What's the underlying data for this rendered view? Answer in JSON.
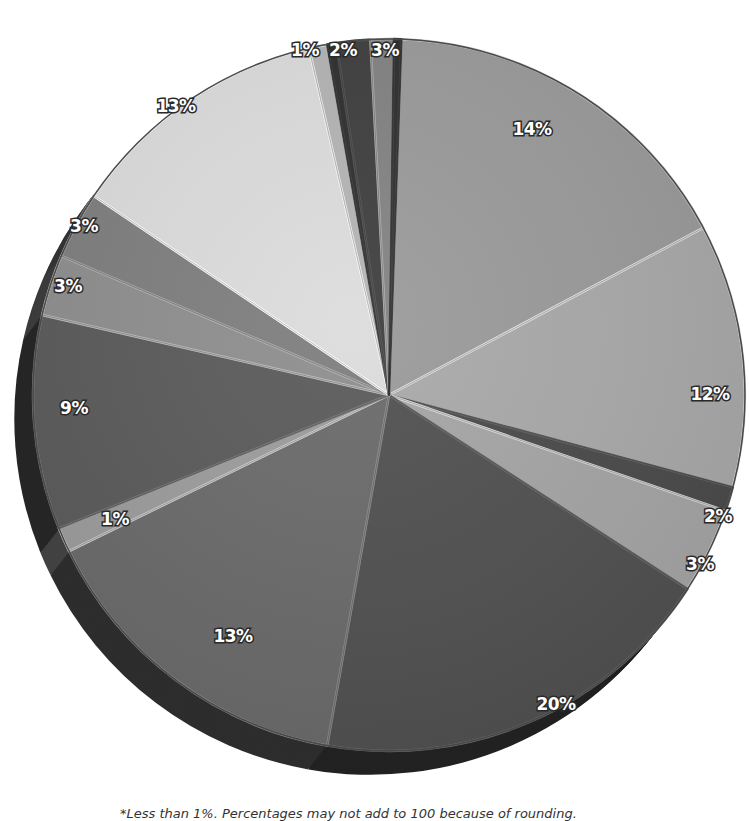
{
  "chart_data": {
    "type": "pie",
    "title": "",
    "style": "3d-exploded-grayscale",
    "center": [
      389,
      395
    ],
    "radius": 356,
    "start_angle_deg": 2,
    "slices": [
      {
        "label": "14%",
        "value": 14,
        "start": 2,
        "end": 62,
        "color": "#9a9a9a",
        "label_pos": [
          532,
          135
        ]
      },
      {
        "label": "12%",
        "value": 12,
        "start": 62,
        "end": 105,
        "color": "#a9a9a9",
        "label_pos": [
          710,
          400
        ]
      },
      {
        "label": "2%",
        "value": 2,
        "start": 105,
        "end": 109,
        "color": "#4a4a4a",
        "label_pos": [
          718,
          522
        ]
      },
      {
        "label": "3%",
        "value": 3,
        "start": 109,
        "end": 123,
        "color": "#a5a5a5",
        "label_pos": [
          700,
          570
        ]
      },
      {
        "label": "20%",
        "value": 20,
        "start": 123,
        "end": 190,
        "color": "#505050",
        "label_pos": [
          556,
          710
        ]
      },
      {
        "label": "13%",
        "value": 13,
        "start": 190,
        "end": 244,
        "color": "#6a6a6a",
        "label_pos": [
          233,
          642
        ]
      },
      {
        "label": "1%",
        "value": 1,
        "start": 244,
        "end": 248,
        "color": "#9c9c9c",
        "label_pos": [
          115,
          525
        ]
      },
      {
        "label": "9%",
        "value": 9,
        "start": 248,
        "end": 283,
        "color": "#5a5a5a",
        "label_pos": [
          74,
          414
        ]
      },
      {
        "label": "3%",
        "value": 3,
        "start": 283,
        "end": 293,
        "color": "#8e8e8e",
        "label_pos": [
          68,
          292
        ]
      },
      {
        "label": "3%",
        "value": 3,
        "start": 293,
        "end": 304,
        "color": "#7e7e7e",
        "label_pos": [
          84,
          232
        ]
      },
      {
        "label": "13%",
        "value": 13,
        "start": 304,
        "end": 347,
        "color": "#dcdcdc",
        "label_pos": [
          176,
          112
        ]
      },
      {
        "label": "1%",
        "value": 1,
        "start": 347,
        "end": 350,
        "color": "#b4b4b4",
        "label_pos": [
          305,
          56
        ]
      },
      {
        "label": "",
        "value": 0.5,
        "start": 350,
        "end": 351.5,
        "color": "#2e2e2e",
        "label_pos": null
      },
      {
        "label": "2%",
        "value": 2,
        "start": 351.5,
        "end": 357,
        "color": "#3e3e3e",
        "label_pos": [
          343,
          56
        ]
      },
      {
        "label": "3%",
        "value": 3,
        "start": 357,
        "end": 0.8,
        "color": "#828282",
        "label_pos": [
          385,
          56
        ]
      },
      {
        "label": "",
        "value": 0.5,
        "start": 0.8,
        "end": 2,
        "color": "#2e2e2e",
        "label_pos": null
      }
    ],
    "values": [
      14,
      12,
      2,
      3,
      20,
      13,
      1,
      9,
      3,
      3,
      13,
      1,
      0.5,
      2,
      3,
      0.5
    ],
    "categories": [
      "14%",
      "12%",
      "2%",
      "3%",
      "20%",
      "13%",
      "1%",
      "9%",
      "3%",
      "3%",
      "13%",
      "1%",
      "<1%",
      "2%",
      "3%",
      "<1%"
    ],
    "legend": null,
    "footnote": "*Less than 1%. Percentages may not add to 100 because of rounding."
  }
}
